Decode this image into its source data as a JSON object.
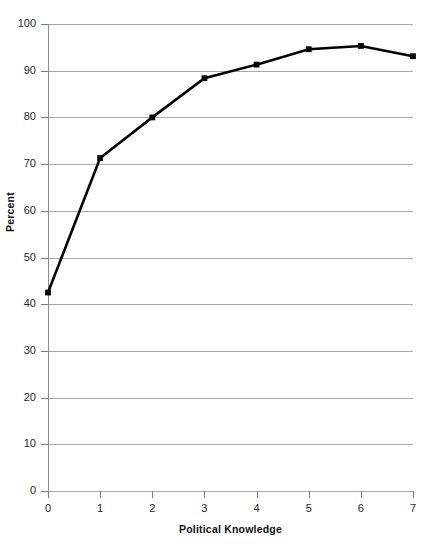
{
  "chart_data": {
    "type": "line",
    "title": "",
    "xlabel": "Political Knowledge",
    "ylabel": "Percent",
    "x": [
      0,
      1,
      2,
      3,
      4,
      5,
      6,
      7
    ],
    "values": [
      42.5,
      71.3,
      80.0,
      88.4,
      91.3,
      94.6,
      95.3,
      93.1
    ],
    "series": [
      {
        "name": "Percent",
        "values": [
          42.5,
          71.3,
          80.0,
          88.4,
          91.3,
          94.6,
          95.3,
          93.1
        ]
      }
    ],
    "xlim": [
      0,
      7
    ],
    "ylim": [
      0,
      100
    ],
    "x_tick_labels": [
      "0",
      "1",
      "2",
      "3",
      "4",
      "5",
      "6",
      "7"
    ],
    "y_tick_labels": [
      "0",
      "10",
      "20",
      "30",
      "40",
      "50",
      "60",
      "70",
      "80",
      "90",
      "100"
    ],
    "y_ticks": [
      0,
      10,
      20,
      30,
      40,
      50,
      60,
      70,
      80,
      90,
      100
    ],
    "grid": "horizontal",
    "legend": "none",
    "line_color": "#000000",
    "marker": "square",
    "marker_color": "#000000",
    "gridline_color": "#a9a9a9",
    "axis_color": "#8c8c8c",
    "background_color": "#ffffff"
  }
}
